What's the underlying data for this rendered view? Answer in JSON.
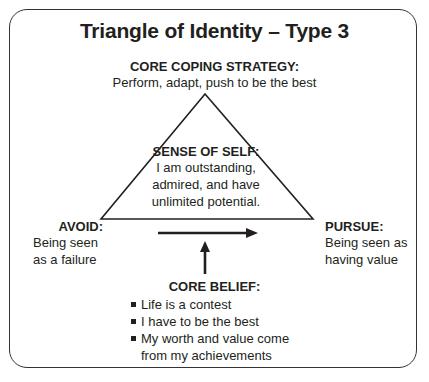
{
  "title": "Triangle of Identity – Type 3",
  "core_coping_strategy": {
    "heading": "CORE COPING STRATEGY:",
    "text": "Perform, adapt, push to be the best"
  },
  "sense_of_self": {
    "heading": "SENSE OF SELF:",
    "lines": [
      "I am outstanding,",
      "admired, and have",
      "unlimited potential."
    ]
  },
  "avoid": {
    "heading": "AVOID:",
    "lines": [
      "Being seen",
      "as a failure"
    ]
  },
  "pursue": {
    "heading": "PURSUE:",
    "lines": [
      "Being seen as",
      "having value"
    ]
  },
  "core_belief": {
    "heading": "CORE BELIEF:",
    "items": [
      "Life is a contest",
      "I have to be the best",
      "My worth and value come from my achievements"
    ]
  },
  "colors": {
    "ink": "#231f20",
    "border": "#333333",
    "background": "#ffffff"
  }
}
